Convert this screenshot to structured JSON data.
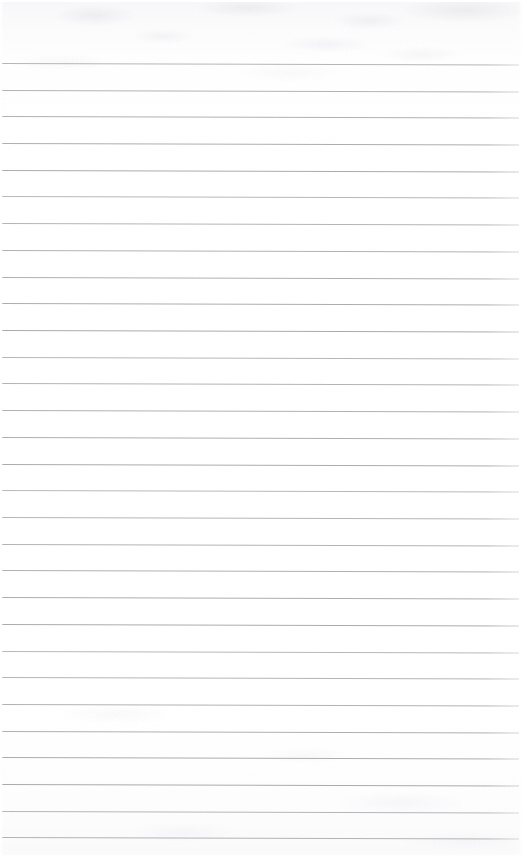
{
  "document": {
    "kind": "scanned-lined-notebook-page",
    "title": "Blank Lined Notebook Page",
    "page_width": 527,
    "page_height": 856,
    "content_text": "",
    "has_handwriting": false,
    "has_printed_text": false
  },
  "colors": {
    "paper": "#fdfdfd",
    "rule_line": "#a9a9ad",
    "scan_noise": "#cbcdd4",
    "edge_highlight": "#ffffff"
  },
  "ruling": {
    "style": "wide-ruled-horizontal",
    "line_count": 30,
    "first_line_y": 63,
    "line_spacing": 26.7,
    "line_thickness": 1,
    "line_start_x": 2,
    "line_end_x": 519,
    "skew_degrees": 0.18,
    "margin_rule": "none",
    "header_band_height": 62,
    "footer_band_height": 18,
    "lines": [
      {
        "index": 1,
        "y": 63
      },
      {
        "index": 2,
        "y": 90
      },
      {
        "index": 3,
        "y": 116
      },
      {
        "index": 4,
        "y": 143
      },
      {
        "index": 5,
        "y": 170
      },
      {
        "index": 6,
        "y": 196
      },
      {
        "index": 7,
        "y": 223
      },
      {
        "index": 8,
        "y": 250
      },
      {
        "index": 9,
        "y": 277
      },
      {
        "index": 10,
        "y": 303
      },
      {
        "index": 11,
        "y": 330
      },
      {
        "index": 12,
        "y": 357
      },
      {
        "index": 13,
        "y": 383
      },
      {
        "index": 14,
        "y": 410
      },
      {
        "index": 15,
        "y": 437
      },
      {
        "index": 16,
        "y": 464
      },
      {
        "index": 17,
        "y": 490
      },
      {
        "index": 18,
        "y": 517
      },
      {
        "index": 19,
        "y": 544
      },
      {
        "index": 20,
        "y": 570
      },
      {
        "index": 21,
        "y": 597
      },
      {
        "index": 22,
        "y": 624
      },
      {
        "index": 23,
        "y": 651
      },
      {
        "index": 24,
        "y": 677
      },
      {
        "index": 25,
        "y": 704
      },
      {
        "index": 26,
        "y": 731
      },
      {
        "index": 27,
        "y": 757
      },
      {
        "index": 28,
        "y": 784
      },
      {
        "index": 29,
        "y": 811
      },
      {
        "index": 30,
        "y": 837
      }
    ]
  }
}
